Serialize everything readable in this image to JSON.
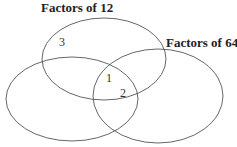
{
  "diagram": {
    "type": "venn",
    "sets": [
      {
        "id": "top",
        "label": "Factors of 12"
      },
      {
        "id": "right",
        "label": "Factors of 64"
      },
      {
        "id": "left",
        "label": ""
      }
    ],
    "labels": {
      "factors12": "Factors of 12",
      "factors64": "Factors of 64"
    },
    "numbers": {
      "three": "3",
      "one": "1",
      "two": "2"
    },
    "colors": {
      "stroke": "#555555",
      "text": "#222222",
      "background": "#ffffff"
    }
  }
}
